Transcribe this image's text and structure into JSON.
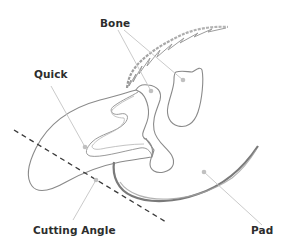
{
  "diagram": {
    "labels": {
      "bone": "Bone",
      "quick": "Quick",
      "cutting_angle": "Cutting Angle",
      "pad": "Pad"
    },
    "colors": {
      "outline": "#8a8a8a",
      "leader_line": "#c4c4c4",
      "marker_dot": "#c0c0c0",
      "dashed_line": "#3a3a3a",
      "label_text": "#2d2d2d",
      "background": "#ffffff"
    }
  }
}
